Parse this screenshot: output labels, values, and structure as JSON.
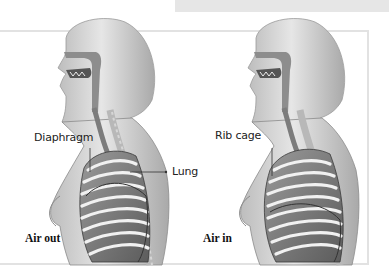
{
  "diagram": {
    "panels": [
      {
        "id": "exhale",
        "caption": "Air out",
        "labels": {
          "diaphragm": "Diaphragm",
          "lung": "Lung"
        }
      },
      {
        "id": "inhale",
        "caption": "Air in",
        "labels": {
          "rib_cage": "Rib cage"
        }
      }
    ],
    "colors": {
      "skin": "#c9c9c9",
      "skin_highlight": "#e4e4e4",
      "rib": "#f2f2f2",
      "rib_shadow": "#6e6e6e",
      "outline": "#4a4a4a",
      "frame": "#e2e2e2",
      "top_bar": "#e6e6e6"
    }
  }
}
